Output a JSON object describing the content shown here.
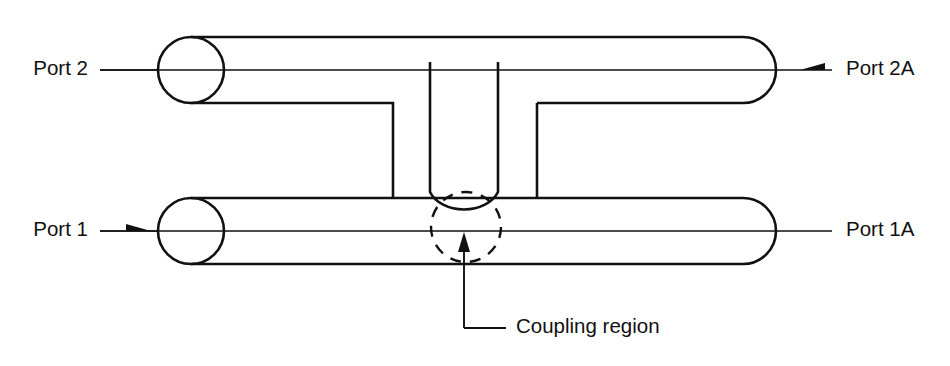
{
  "diagram": {
    "background_color": "#ffffff",
    "line_color": "#111111",
    "labels": {
      "port_2": "Port 2",
      "port_1": "Port 1",
      "port_2a": "Port 2A",
      "port_1a": "Port 1A",
      "coupling_region": "Coupling region"
    },
    "annotation": {
      "callout_text": "Coupling region",
      "callout_target": "coupling-region-circle"
    },
    "ports": [
      {
        "id": "port-2",
        "label": "Port 2",
        "side": "left",
        "row": "upper",
        "has_arrow": false,
        "arrow_direction": ""
      },
      {
        "id": "port-1",
        "label": "Port 1",
        "side": "left",
        "row": "lower",
        "has_arrow": true,
        "arrow_direction": "right"
      },
      {
        "id": "port-2a",
        "label": "Port 2A",
        "side": "right",
        "row": "upper",
        "has_arrow": true,
        "arrow_direction": "right"
      },
      {
        "id": "port-1a",
        "label": "Port 1A",
        "side": "right",
        "row": "lower",
        "has_arrow": false,
        "arrow_direction": ""
      }
    ],
    "features": {
      "upper_waveguide": "horizontal guide with rounded left end cap and rounded right end cap",
      "lower_waveguide": "horizontal guide with rounded left end cap and rounded right end cap",
      "u_bend": "central U-shaped branch descending from upper guide into the coupling region",
      "coupling_marker": "dashed circle around the evanescent coupling zone"
    }
  }
}
